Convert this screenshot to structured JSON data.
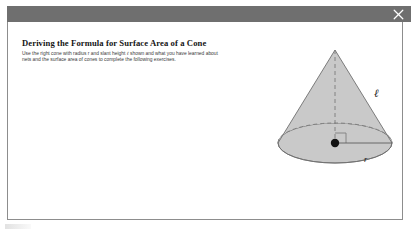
{
  "window": {
    "close_icon": "close-icon",
    "titlebar_color": "#6f6f6f",
    "border_color": "#8d8d8d",
    "background_color": "#ffffff"
  },
  "lesson": {
    "title": "Deriving the Formula for Surface Area of a Cone",
    "instructions_part1": "Use the right cone with radius r and slant height ",
    "instructions_slant_symbol": "ℓ",
    "instructions_part2": " shown and what you have learned about nets and the surface area of cones to complete the following exercises."
  },
  "figure": {
    "name": "right-cone-diagram",
    "fill_color": "#c8c8c8",
    "stroke_color": "#6b6b6b",
    "labels": {
      "slant_height": "ℓ",
      "radius": "r"
    },
    "features": [
      "dashed-vertical-height",
      "dashed-back-ellipse-arc",
      "right-angle-mark",
      "center-point-dot",
      "solid-radius-segment"
    ]
  }
}
